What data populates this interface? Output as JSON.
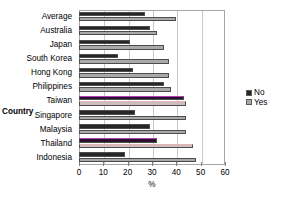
{
  "chart_data": {
    "type": "bar",
    "orientation": "horizontal",
    "title": "",
    "xlabel": "%",
    "ylabel": "Country",
    "xlim": [
      0,
      60
    ],
    "ylim": null,
    "xticks": [
      0,
      10,
      20,
      30,
      40,
      50,
      60
    ],
    "xtick_labels": [
      "0",
      "10",
      "20",
      "30",
      "40",
      "50",
      "60"
    ],
    "grid": true,
    "grid_axis": "x",
    "legend_position": "right",
    "categories": [
      "Average",
      "Australia",
      "Japan",
      "South Korea",
      "Hong Kong",
      "Philippines",
      "Taiwan",
      "Singapore",
      "Malaysia",
      "Thailand",
      "Indonesia"
    ],
    "series": [
      {
        "name": "No",
        "color": "#262626",
        "values": [
          27,
          29,
          21,
          16,
          22,
          35,
          43,
          23,
          29,
          32,
          19
        ]
      },
      {
        "name": "Yes",
        "color": "#a9a9a9",
        "values": [
          40,
          32,
          35,
          37,
          37,
          38,
          44,
          44,
          44,
          47,
          48
        ]
      }
    ],
    "highlighted_categories": [
      "Taiwan",
      "Thailand"
    ]
  },
  "legend": {
    "entries": [
      {
        "label": "No",
        "marker": "legend-swatch-no"
      },
      {
        "label": "Yes",
        "marker": "legend-swatch-yes"
      }
    ]
  },
  "axes": {
    "y_title": "Country",
    "x_title": "%"
  }
}
